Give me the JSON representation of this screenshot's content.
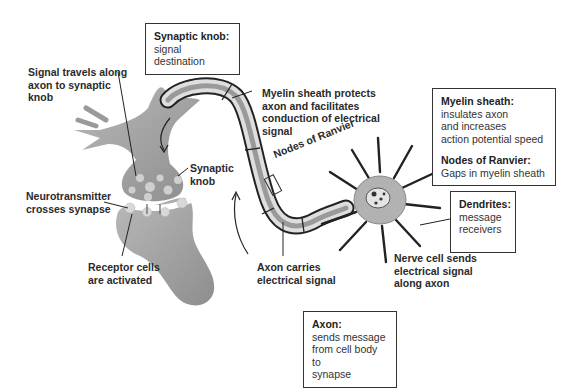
{
  "diagram": {
    "colors": {
      "tissue": "#a9a9a9",
      "tissue_dark": "#8a8a8a",
      "myelin": "#d9d9d9",
      "vesicle": "#cfcfcf",
      "outline": "#222222",
      "background": "#ffffff"
    }
  },
  "boxes": {
    "synaptic_knob": {
      "title": "Synaptic knob:",
      "desc": "signal destination"
    },
    "myelin_nodes": {
      "title1": "Myelin sheath:",
      "desc1": "insulates axon\nand increases\naction potential speed",
      "title2": "Nodes of Ranvier:",
      "desc2": "Gaps in myelin sheath"
    },
    "dendrites": {
      "title": "Dendrites:",
      "desc": "message\nreceivers"
    },
    "axon": {
      "title": "Axon:",
      "desc": "sends message\nfrom cell body to\nsynapse"
    }
  },
  "labels": {
    "signal_travels": "Signal travels along\naxon to synaptic\nknob",
    "myelin_protects": "Myelin sheath protects\naxon and facilitates\nconduction of electrical\nsignal",
    "nodes_of_ranvier": "Nodes of Ranvier",
    "synaptic_knob": "Synaptic\nknob",
    "neurotransmitter": "Neurotransmitter\ncrosses synapse",
    "receptor_cells": "Receptor cells\nare activated",
    "axon_carries": "Axon carries\nelectrical signal",
    "nerve_cell_sends": "Nerve cell sends\nelectrical signal\nalong axon"
  }
}
